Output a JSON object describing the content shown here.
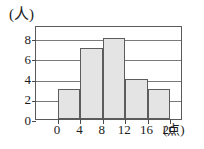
{
  "chart_data": {
    "type": "bar",
    "title": "",
    "subtitle": "",
    "xlabel": "(点)",
    "ylabel": "(人)",
    "categories": [
      "0-4",
      "4-8",
      "8-12",
      "12-16",
      "16-20"
    ],
    "values": [
      3,
      7,
      8,
      4,
      3
    ],
    "bin_edges": [
      0,
      4,
      8,
      12,
      16,
      20
    ],
    "x_tick_labels": [
      "0",
      "4",
      "8",
      "12",
      "16",
      "20"
    ],
    "y_tick_labels": [
      "0",
      "2",
      "4",
      "6",
      "8"
    ],
    "y_tick_values": [
      0,
      2,
      4,
      6,
      8
    ],
    "xlim": [
      0,
      20
    ],
    "ylim": [
      0,
      8
    ],
    "grid": true,
    "grid_axis": "y",
    "legend": false,
    "legend_position": "none",
    "histogram": true,
    "annotations": [],
    "colors": {
      "bar_fill": "#e4e4e4",
      "bar_edge": "#5c5c5c",
      "grid": "#7a7a7a",
      "frame": "#5a5a5a",
      "text": "#1b1b1b",
      "background": "#ffffff"
    }
  }
}
